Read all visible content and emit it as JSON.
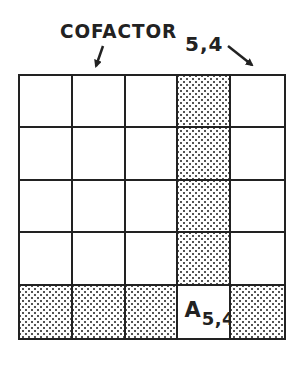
{
  "diagram": {
    "title_label": "COFACTOR",
    "title_index": "5,4",
    "grid": {
      "rows": 5,
      "cols": 5,
      "highlighted_row": 5,
      "highlighted_col": 4,
      "shaded_fill": "stippled",
      "line_color": "#222222",
      "background": "#ffffff"
    },
    "pivot_cell": {
      "row": 5,
      "col": 4,
      "label_main": "A",
      "label_sub": "5,4"
    },
    "arrows": [
      {
        "name": "cofactor-arrow",
        "points_to": "grid-top-col-2"
      },
      {
        "name": "index-arrow",
        "points_to": "grid-top-right-corner"
      }
    ]
  }
}
